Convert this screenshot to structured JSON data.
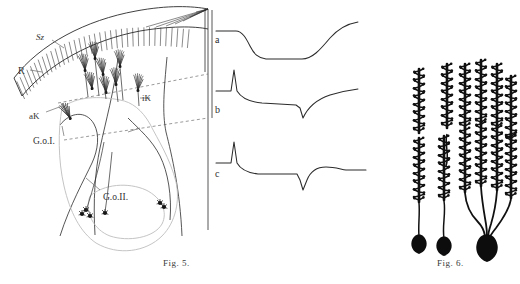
{
  "figures": {
    "fig5": {
      "caption": "Fig. 5.",
      "labels": {
        "sz": "Sᴢ",
        "r": "R",
        "ak": "aK",
        "ik": "iK",
        "goi": "G.o.I.",
        "goii": "G.o.II."
      },
      "traces": [
        {
          "id": "a",
          "label": "a"
        },
        {
          "id": "b",
          "label": "b"
        },
        {
          "id": "c",
          "label": "c"
        }
      ]
    },
    "fig6": {
      "caption": "Fig. 6.",
      "cells": [
        {
          "id": "cell-1",
          "type": "single-spiny-dendrite"
        },
        {
          "id": "cell-2",
          "type": "single-spiny-dendrite"
        },
        {
          "id": "cell-3",
          "type": "branched-spiny-dendrite"
        }
      ]
    }
  },
  "style": {
    "ink": "#2b2b2b",
    "ink_light": "#8a8a8a",
    "background": "#ffffff"
  }
}
